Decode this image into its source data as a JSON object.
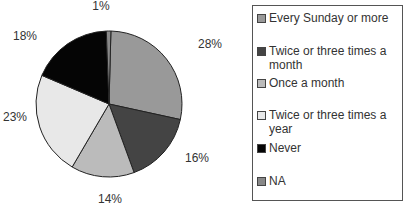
{
  "chart_data": {
    "type": "pie",
    "title": "",
    "categories": [
      "Every Sunday or more",
      "Twice or three times a month",
      "Once a month",
      "Twice or three times a year",
      "Never",
      "NA"
    ],
    "values": [
      28,
      16,
      14,
      23,
      18,
      1
    ],
    "labels": [
      "28%",
      "16%",
      "14%",
      "23%",
      "18%",
      "1%"
    ],
    "colors": [
      "#999999",
      "#444444",
      "#bbbbbb",
      "#e8e8e8",
      "#050505",
      "#888888"
    ],
    "start_angle_deg": 0,
    "direction": "clockwise",
    "legend_position": "right"
  },
  "legend": {
    "items": [
      {
        "label": "Every Sunday or more",
        "color": "#999999"
      },
      {
        "label": "Twice or three times a month",
        "color": "#444444"
      },
      {
        "label": "Once a month",
        "color": "#bbbbbb"
      },
      {
        "label": "Twice or three times a year",
        "color": "#e8e8e8"
      },
      {
        "label": "Never",
        "color": "#050505"
      },
      {
        "label": "NA",
        "color": "#888888"
      }
    ]
  }
}
